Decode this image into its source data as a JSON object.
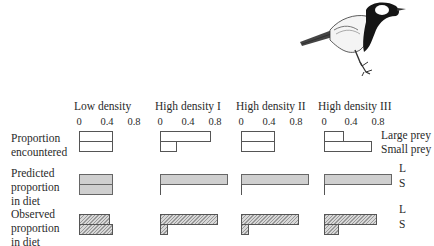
{
  "chart_data": {
    "type": "bar",
    "orientation": "horizontal",
    "title": "",
    "panels": [
      "Low density",
      "High density I",
      "High density II",
      "High density III"
    ],
    "x_ticks": [
      "0",
      "0.4",
      "0.8"
    ],
    "xlim": [
      0,
      1.0
    ],
    "rows": [
      {
        "label": "Proportion encountered",
        "series": [
          {
            "name": "Large prey",
            "values": [
              0.5,
              0.75,
              0.5,
              0.3
            ]
          },
          {
            "name": "Small prey",
            "values": [
              0.5,
              0.25,
              0.5,
              0.7
            ]
          }
        ]
      },
      {
        "label": "Predicted proportion in diet",
        "series": [
          {
            "name": "L",
            "values": [
              0.5,
              1.0,
              1.0,
              1.0
            ]
          },
          {
            "name": "S",
            "values": [
              0.5,
              0.0,
              0.0,
              0.0
            ]
          }
        ]
      },
      {
        "label": "Observed proportion in diet",
        "series": [
          {
            "name": "L",
            "values": [
              0.45,
              0.85,
              0.85,
              0.78
            ]
          },
          {
            "name": "S",
            "values": [
              0.5,
              0.12,
              0.12,
              0.22
            ]
          }
        ]
      }
    ],
    "legend": [
      "Large prey",
      "Small prey"
    ],
    "grid": false
  },
  "headers": {
    "p0": "Low density",
    "p1": "High density I",
    "p2": "High density II",
    "p3": "High density III"
  },
  "ticks": {
    "t0": "0",
    "t1": "0.4",
    "t2": "0.8"
  },
  "row_labels": {
    "r1a": "Proportion",
    "r1b": "encountered",
    "r2a": "Predicted",
    "r2b": "proportion",
    "r2c": "in diet",
    "r3a": "Observed",
    "r3b": "proportion",
    "r3c": "in diet"
  },
  "side_labels": {
    "large": "Large prey",
    "small": "Small prey",
    "L": "L",
    "S": "S"
  },
  "image": {
    "subject": "great-tit-bird-illustration"
  }
}
